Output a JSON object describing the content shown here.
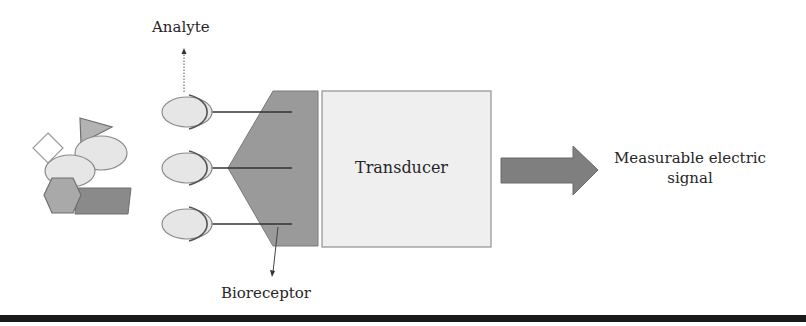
{
  "diagram": {
    "type": "biosensor schematic",
    "labels": {
      "analyte": "Analyte",
      "bioreceptor": "Bioreceptor",
      "transducer": "Transducer",
      "output": "Measurable electric signal"
    },
    "components": [
      {
        "id": "analyte-mixture",
        "description": "mixture of analyte shapes: diamond, triangle, two ellipses, hexagon, parallelogram"
      },
      {
        "id": "bound-analytes",
        "count": 3,
        "description": "ellipses held in receptor cups"
      },
      {
        "id": "bioreceptor",
        "description": "dark gray hexagonal block with three binding arms"
      },
      {
        "id": "transducer",
        "description": "light gray box labeled Transducer"
      },
      {
        "id": "output-arrow",
        "description": "thick gray arrow to measurable electric signal"
      }
    ],
    "colors": {
      "analyte_fill": "#e6e6e6",
      "bioreceptor_fill": "#9a9a9a",
      "transducer_fill": "#efefef",
      "arrow_fill": "#7f7f7f",
      "triangle_fill": "#b3b3b3",
      "hexagon_fill": "#a9a9a9",
      "parallelogram_fill": "#8a8a8a",
      "stroke": "#7a7a7a",
      "bottom_bar": "#1a1a1a"
    }
  }
}
